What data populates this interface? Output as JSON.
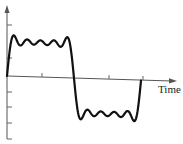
{
  "chart_data": {
    "type": "line",
    "title": "",
    "xlabel": "Time",
    "ylabel": "",
    "series": [
      {
        "name": "square-wave-fourier-approximation",
        "harmonics": [
          1,
          3,
          5,
          7,
          9
        ],
        "coefficients": [
          1,
          0.3333,
          0.2,
          0.1429,
          0.1111
        ],
        "t_range": [
          0,
          6.2832
        ],
        "color": "#111111"
      }
    ],
    "x_ticks": 3,
    "y_ticks_above": 2,
    "y_ticks_below": 4,
    "tick_labels": [],
    "grid": false,
    "legend": false,
    "ylim": [
      -1.35,
      1.85
    ]
  },
  "axes": {
    "x_label": "Time",
    "axis_color": "#555555",
    "curve_color": "#111111"
  }
}
